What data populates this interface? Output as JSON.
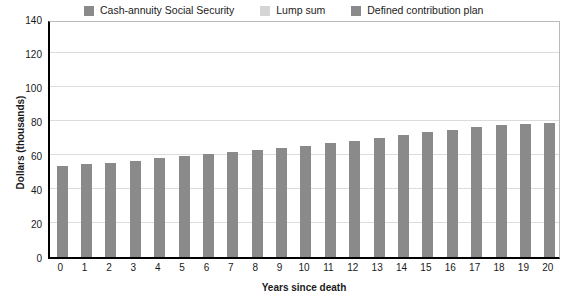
{
  "chart_data": {
    "type": "bar",
    "title": "",
    "subtitle": "",
    "xlabel": "Years since death",
    "ylabel": "Dollars (thousands)",
    "categories": [
      "0",
      "1",
      "2",
      "3",
      "4",
      "5",
      "6",
      "7",
      "8",
      "9",
      "10",
      "11",
      "12",
      "13",
      "14",
      "15",
      "16",
      "17",
      "18",
      "19",
      "20"
    ],
    "series": [
      {
        "name": "Defined contribution plan",
        "color": "#8a8a8a",
        "values": [
          53.5,
          54.5,
          55.5,
          56.5,
          58,
          59.5,
          60.5,
          61.5,
          63,
          64,
          65.5,
          67,
          68.5,
          70,
          71.5,
          73.5,
          74.5,
          76.5,
          77.5,
          78.5,
          79
        ]
      }
    ],
    "ylim": [
      0,
      140
    ],
    "yticks": [
      0,
      20,
      40,
      60,
      80,
      100,
      120,
      140
    ],
    "ytick_labels": [
      "0",
      "20",
      "40",
      "60",
      "80",
      "100",
      "120",
      "140"
    ],
    "grid": true,
    "grid_axis": "y",
    "legend_position": "top",
    "legend": [
      {
        "label": "Cash-annuity Social Security",
        "color": "#8a8a8a"
      },
      {
        "label": "Lump sum",
        "color": "#d5d5d5"
      },
      {
        "label": "Defined contribution plan",
        "color": "#8a8a8a"
      }
    ]
  }
}
